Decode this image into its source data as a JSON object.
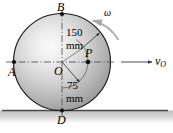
{
  "figure": {
    "points": {
      "B": "B",
      "A": "A",
      "O": "O",
      "P": "P",
      "D": "D"
    },
    "dimensions": {
      "outer_value": "150",
      "outer_unit": "mm",
      "inner_value": "75",
      "inner_unit": "mm"
    },
    "annotations": {
      "omega": "ω",
      "velocity_symbol": "v",
      "velocity_subscript": "O"
    },
    "colors": {
      "wheel_light": "#f2f2f2",
      "wheel_mid": "#c9c9c9",
      "wheel_dark": "#8f8f8f",
      "outline": "#1a1a1a",
      "ground": "#4d4d4d",
      "centerline": "#555555",
      "arc_arrow": "#b5b5b5"
    },
    "geometry": {
      "center_x": 62,
      "center_y": 62,
      "outer_radius": 50,
      "inner_radius": 26
    }
  }
}
